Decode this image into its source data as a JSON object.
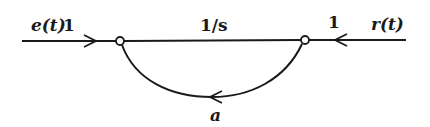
{
  "diagram": {
    "type": "signal-flow-graph",
    "labels": {
      "input_signal": "e(t)",
      "input_gain": "1",
      "forward_gain": "1/s",
      "output_gain": "1",
      "output_signal": "r(t)",
      "feedback_gain": "a"
    },
    "nodes": [
      {
        "id": "n1",
        "x": 120,
        "y": 41
      },
      {
        "id": "n2",
        "x": 305,
        "y": 40
      }
    ],
    "branches": [
      {
        "from": "e(t)",
        "to": "n1",
        "gain": "1"
      },
      {
        "from": "n1",
        "to": "n2",
        "gain": "1/s"
      },
      {
        "from": "r(t)",
        "to": "n2",
        "gain": "1"
      },
      {
        "from": "n2",
        "to": "n1",
        "gain": "a"
      }
    ],
    "colors": {
      "line": "#1a1a1a",
      "background": "#ffffff"
    }
  }
}
